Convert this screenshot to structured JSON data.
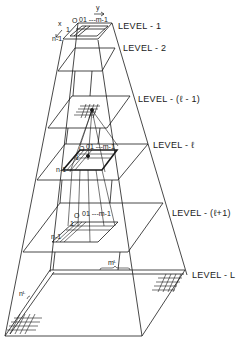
{
  "diagram": {
    "type": "pyramid",
    "levels": [
      {
        "id": "level-1",
        "label": "LEVEL - 1"
      },
      {
        "id": "level-2",
        "label": "LEVEL - 2"
      },
      {
        "id": "level-l-minus-1",
        "label": "LEVEL - (ℓ - 1)"
      },
      {
        "id": "level-l",
        "label": "LEVEL - ℓ"
      },
      {
        "id": "level-l-plus-1",
        "label": "LEVEL - (ℓ+1)"
      },
      {
        "id": "level-L",
        "label": "LEVEL - L"
      }
    ],
    "axes": {
      "x_label": "x",
      "y_label": "y"
    },
    "grid_labels": {
      "origin": "O",
      "col_range": "01 ---m-1",
      "row_one": "1",
      "row_last": "n-1"
    },
    "dimension_labels": {
      "width": "mᴸ",
      "height": "nᴸ"
    },
    "colors": {
      "line": "#1a1a1a",
      "background": "#ffffff"
    }
  }
}
